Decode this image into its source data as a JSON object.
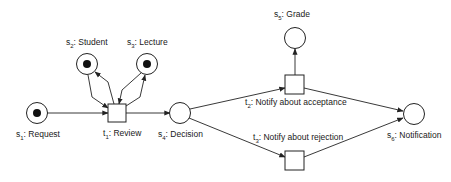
{
  "places": [
    {
      "id": "s1",
      "prefix": "s",
      "sub": "1",
      "name": ": Request",
      "cx": 37,
      "cy": 113,
      "token": true,
      "lx": 16,
      "ly": 137
    },
    {
      "id": "s2",
      "prefix": "s",
      "sub": "2",
      "name": ": Student",
      "cx": 87,
      "cy": 64,
      "token": true,
      "lx": 66,
      "ly": 45
    },
    {
      "id": "s3",
      "prefix": "s",
      "sub": "3",
      "name": ": Lecture",
      "cx": 147,
      "cy": 64,
      "token": true,
      "lx": 127,
      "ly": 45
    },
    {
      "id": "s4",
      "prefix": "s",
      "sub": "4",
      "name": ": Decision",
      "cx": 180,
      "cy": 113,
      "token": false,
      "lx": 158,
      "ly": 137
    },
    {
      "id": "s5",
      "prefix": "s",
      "sub": "5",
      "name": ": Grade",
      "cx": 295,
      "cy": 38,
      "token": false,
      "lx": 274,
      "ly": 17
    },
    {
      "id": "s6",
      "prefix": "s",
      "sub": "6",
      "name": ": Notification",
      "cx": 414,
      "cy": 114,
      "token": false,
      "lx": 387,
      "ly": 138
    }
  ],
  "transitions": [
    {
      "id": "t1",
      "prefix": "t",
      "sub": "1",
      "name": ": Review",
      "x": 108,
      "y": 104,
      "w": 18,
      "h": 18,
      "lx": 103,
      "ly": 136
    },
    {
      "id": "t2",
      "prefix": "t",
      "sub": "2",
      "name": ": Notify about acceptance",
      "x": 285,
      "y": 75,
      "w": 19,
      "h": 19,
      "lx": 245,
      "ly": 105
    },
    {
      "id": "t3",
      "prefix": "t",
      "sub": "3",
      "name": ": Notify about rejection",
      "x": 285,
      "y": 151,
      "w": 19,
      "h": 19,
      "lx": 253,
      "ly": 140
    }
  ],
  "arcs": [
    {
      "from": "s1",
      "to": "t1",
      "d": "M47,113 L108,113"
    },
    {
      "from": "s2",
      "to": "t1",
      "d": "M88,75 L92,97 L108,108"
    },
    {
      "from": "t1",
      "to": "s2",
      "d": "M114,104 L108,82 L95,72"
    },
    {
      "from": "s3",
      "to": "t1",
      "d": "M141,73 L122,90 L119,104"
    },
    {
      "from": "t1",
      "to": "s3",
      "d": "M126,106 L140,97 L145,75"
    },
    {
      "from": "t1",
      "to": "s4",
      "d": "M126,113 L170,113"
    },
    {
      "from": "s4",
      "to": "t2",
      "d": "M190,109 L285,88"
    },
    {
      "from": "s4",
      "to": "t3",
      "d": "M189,118 L285,157"
    },
    {
      "from": "t2",
      "to": "s5",
      "d": "M295,75 L295,49"
    },
    {
      "from": "t2",
      "to": "s6",
      "d": "M304,88 L403,111"
    },
    {
      "from": "t3",
      "to": "s6",
      "d": "M304,157 L403,118"
    }
  ]
}
